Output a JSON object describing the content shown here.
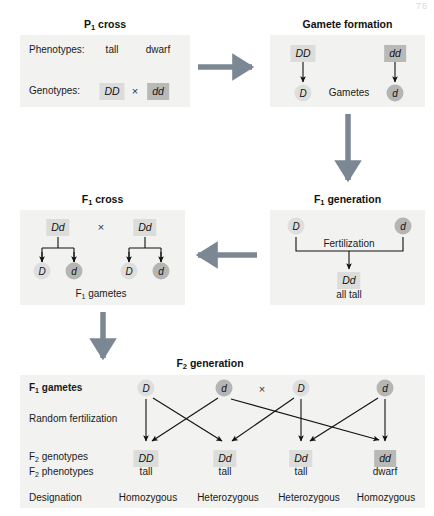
{
  "figure": {
    "corner_mark": "76",
    "accent_arrow_color": "#7b8792",
    "panel_bg": "#f2f2f0",
    "chip_light": "#dcdcda",
    "chip_dark": "#b9b9b7"
  },
  "p1_cross": {
    "title": "P",
    "title_sub": "1",
    "title_rest": " cross",
    "phenotypes_label": "Phenotypes:",
    "phenotype_values": [
      "tall",
      "dwarf"
    ],
    "genotypes_label": "Genotypes:",
    "genotype_left": "DD",
    "cross_symbol": "×",
    "genotype_right": "dd"
  },
  "gamete_formation": {
    "title": "Gamete formation",
    "parent_left": "DD",
    "parent_right": "dd",
    "gamete_left": "D",
    "gametes_label": "Gametes",
    "gamete_right": "d"
  },
  "f1_generation": {
    "title": "F",
    "title_sub": "1",
    "title_rest": " generation",
    "gamete_left": "D",
    "gamete_right": "d",
    "fertilization_label": "Fertilization",
    "offspring_genotype": "Dd",
    "offspring_phenotype": "all tall"
  },
  "f1_cross": {
    "title": "F",
    "title_sub": "1",
    "title_rest": " cross",
    "parent_left": "Dd",
    "cross_symbol": "×",
    "parent_right": "Dd",
    "gametes_left": [
      "D",
      "d"
    ],
    "gametes_right": [
      "D",
      "d"
    ],
    "caption": "F",
    "caption_sub": "1",
    "caption_rest": " gametes"
  },
  "f2_generation": {
    "title": "F",
    "title_sub": "2",
    "title_rest": " generation",
    "row_labels": {
      "gametes": "F",
      "gametes_sub": "1",
      "gametes_rest": " gametes",
      "random_fertilization": "Random fertilization",
      "genotypes": "F",
      "genotypes_sub": "2",
      "genotypes_rest": " genotypes",
      "phenotypes": "F",
      "phenotypes_sub": "2",
      "phenotypes_rest": " phenotypes",
      "designation": "Designation"
    },
    "gametes": [
      {
        "allele": "D",
        "shade": "light"
      },
      {
        "allele": "d",
        "shade": "dark"
      },
      {
        "allele": "D",
        "shade": "light"
      },
      {
        "allele": "d",
        "shade": "dark"
      }
    ],
    "cross_symbol": "×",
    "genotypes": [
      {
        "value": "DD",
        "shade": "light"
      },
      {
        "value": "Dd",
        "shade": "light"
      },
      {
        "value": "Dd",
        "shade": "light"
      },
      {
        "value": "dd",
        "shade": "dark"
      }
    ],
    "phenotypes": [
      "tall",
      "tall",
      "tall",
      "dwarf"
    ],
    "designations": [
      "Homozygous",
      "Heterozygous",
      "Heterozygous",
      "Homozygous"
    ]
  }
}
